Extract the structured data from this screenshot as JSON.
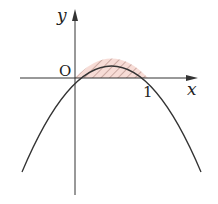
{
  "figure": {
    "type": "function-graph",
    "function": "y = x - x^2",
    "shaded_region": "area enclosed by curve and x-axis between x=0 and x=1",
    "labels": {
      "y_axis": "y",
      "x_axis": "x",
      "origin": "O",
      "x_tick": "1"
    },
    "colors": {
      "axis": "#333333",
      "curve": "#333333",
      "shade_fill": "#f7dcd6",
      "hatch": "#a0766e"
    }
  }
}
